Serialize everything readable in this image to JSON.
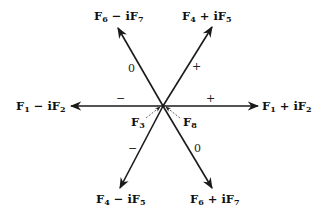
{
  "diagram": {
    "type": "hexagonal-weight-diagram",
    "center": {
      "x": 163,
      "y": 106
    },
    "arrows": [
      {
        "id": "right",
        "label": "F1 + iF2",
        "base": "F",
        "sub1": "1",
        "op": " + i",
        "base2": "F",
        "sub2": "2",
        "sign": "+"
      },
      {
        "id": "left",
        "label": "F1 − iF2",
        "base": "F",
        "sub1": "1",
        "op": " − i",
        "base2": "F",
        "sub2": "2",
        "sign": "−"
      },
      {
        "id": "up-right",
        "label": "F4 + iF5",
        "base": "F",
        "sub1": "4",
        "op": " + i",
        "base2": "F",
        "sub2": "5",
        "sign": "+"
      },
      {
        "id": "down-left",
        "label": "F4 − iF5",
        "base": "F",
        "sub1": "4",
        "op": " − i",
        "base2": "F",
        "sub2": "5",
        "sign": "−"
      },
      {
        "id": "up-left",
        "label": "F6 − iF7",
        "base": "F",
        "sub1": "6",
        "op": " − i",
        "base2": "F",
        "sub2": "7",
        "sign": "0"
      },
      {
        "id": "down-right",
        "label": "F6 + iF7",
        "base": "F",
        "sub1": "6",
        "op": " + i",
        "base2": "F",
        "sub2": "7",
        "sign": "0"
      }
    ],
    "center_labels": [
      {
        "id": "f3",
        "label": "F3",
        "base": "F",
        "sub": "3"
      },
      {
        "id": "f8",
        "label": "F8",
        "base": "F",
        "sub": "8"
      }
    ]
  },
  "colors": {
    "arrow": "#1a1a1a",
    "text": "#111111",
    "background": "#ffffff"
  }
}
